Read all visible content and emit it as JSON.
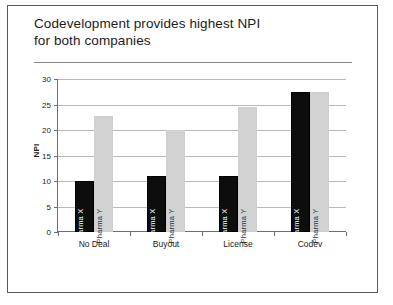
{
  "slide": {
    "title": "Codevelopment provides highest NPI\nfor both companies"
  },
  "chart_data": {
    "type": "bar",
    "title": "Codevelopment provides highest NPI for both companies",
    "xlabel": "",
    "ylabel": "NPI",
    "ylim": [
      0,
      30
    ],
    "yticks": [
      0,
      5,
      10,
      15,
      20,
      25,
      30
    ],
    "ytick_labels": [
      "0",
      "5",
      "10",
      "15",
      "20",
      "25",
      "30"
    ],
    "grid": true,
    "legend": "in-bar",
    "categories": [
      "No Deal",
      "Buyout",
      "License",
      "Codev"
    ],
    "series": [
      {
        "name": "Pharma X",
        "color": "#0d0d0d",
        "values": [
          10,
          11,
          11,
          27.5
        ]
      },
      {
        "name": "Pharma Y",
        "color": "#d2d2d2",
        "values": [
          22.8,
          20,
          24.5,
          27.5
        ]
      }
    ]
  }
}
